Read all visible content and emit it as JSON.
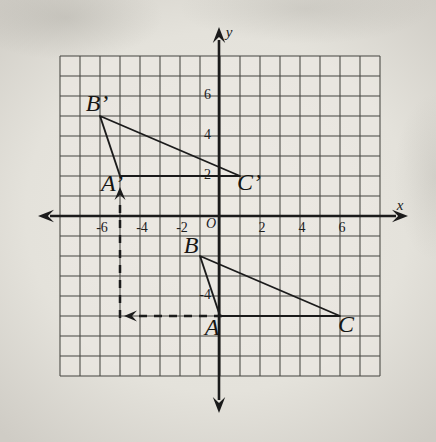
{
  "figure": {
    "axes": {
      "x_label": "x",
      "y_label": "y",
      "origin_label": "O",
      "x_range": [
        -8,
        8
      ],
      "y_range": [
        -8,
        8
      ],
      "grid": true,
      "x_ticks": [
        {
          "v": -6,
          "t": "-6"
        },
        {
          "v": -4,
          "t": "-4"
        },
        {
          "v": -2,
          "t": "-2"
        },
        {
          "v": 2,
          "t": "2"
        },
        {
          "v": 4,
          "t": "4"
        },
        {
          "v": 6,
          "t": "6"
        }
      ],
      "y_ticks": [
        {
          "v": 6,
          "t": "6"
        },
        {
          "v": 4,
          "t": "4"
        },
        {
          "v": 2,
          "t": "2"
        },
        {
          "v": -4,
          "t": "-4"
        }
      ]
    },
    "triangles": [
      {
        "name": "image-triangle",
        "vertices": [
          {
            "label": "A’",
            "x": -5,
            "y": 2
          },
          {
            "label": "B’",
            "x": -6,
            "y": 5
          },
          {
            "label": "C’",
            "x": 1,
            "y": 2
          }
        ]
      },
      {
        "name": "preimage-triangle",
        "vertices": [
          {
            "label": "A",
            "x": 0,
            "y": -5
          },
          {
            "label": "B",
            "x": -1,
            "y": -2
          },
          {
            "label": "C",
            "x": 6,
            "y": -5
          }
        ]
      }
    ],
    "translation": {
      "dx": -5,
      "dy": 7,
      "dashed_segments": [
        {
          "from": {
            "x": 0,
            "y": -5
          },
          "to": {
            "x": -5,
            "y": -5
          },
          "arrow": "left"
        },
        {
          "from": {
            "x": -5,
            "y": -5
          },
          "to": {
            "x": -5,
            "y": 2
          },
          "arrow": "up"
        }
      ]
    },
    "colors": {
      "ink": "#1b1b1b",
      "grid_line": "#454540",
      "paper": "#e4e2db"
    }
  }
}
